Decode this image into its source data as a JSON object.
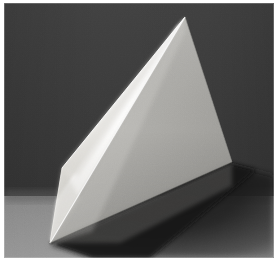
{
  "image": {
    "title": "Photograph of a white tetrahedron on a dark background",
    "subject": "tetrahedron",
    "medium": "photograph",
    "width": 277,
    "height": 258,
    "alt_text": "A white triangular pyramid (tetrahedron) shaped object resting on a gray surface against a dark charcoal backdrop, lit from the left so one face is bright white and the larger face is mid gray."
  },
  "frame": {
    "border_color": "#ffffff",
    "inset_left": 4,
    "inset_top": 3,
    "inset_right": 3,
    "inset_bottom": 0
  },
  "palette": {
    "background_dark": "#3a3a3a",
    "background_dark_top": "#3f3f3f",
    "background_dark_bottom": "#333333",
    "ground_surface": "#8c8c8c",
    "ground_surface_light": "#9a9a9a",
    "facet_bright": "#f4f4f2",
    "facet_bright_edge": "#ffffff",
    "facet_bright_low": "#dedcd8",
    "facet_gray": "#adadad",
    "facet_gray_dark": "#8f8f8f",
    "facet_gray_light": "#c0c0bd",
    "shadow_core": "#141414",
    "shadow_soft": "#2a2a2a",
    "edge_highlight": "#ffffff"
  },
  "geometry": {
    "apex": {
      "x": 185,
      "y": 17
    },
    "left_vertex": {
      "x": 62,
      "y": 168
    },
    "bottom_vertex": {
      "x": 50,
      "y": 243
    },
    "right_vertex": {
      "x": 232,
      "y": 162
    },
    "ridge_top": {
      "x": 185,
      "y": 17
    },
    "ridge_bottom": {
      "x": 50,
      "y": 243
    },
    "horizon_y": 196,
    "notes": "Tetrahedron seen from slightly above; ridge runs from top apex down-left to the bottom near vertex. Bright face on the left of the ridge, mid-gray face on the right."
  },
  "chart_data": {
    "type": "scatter",
    "xlabel": "x (px)",
    "ylabel": "y (px)",
    "xlim": [
      0,
      277
    ],
    "ylim": [
      0,
      258
    ],
    "categories": [
      "apex",
      "left-vertex",
      "bottom-vertex",
      "right-vertex"
    ],
    "x": [
      185,
      62,
      50,
      232
    ],
    "y": [
      17,
      168,
      243,
      162
    ]
  },
  "lighting": {
    "key_light_direction": "upper-left",
    "shadow_direction": "lower-right",
    "contrast": "high"
  }
}
